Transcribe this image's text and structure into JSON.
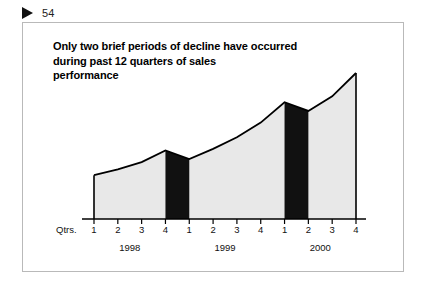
{
  "page": {
    "marker_icon": "play-triangle-icon",
    "folio": "54"
  },
  "figure": {
    "title_lines": [
      "Only two brief periods of decline have occurred",
      "during past 12 quarters of sales",
      "performance"
    ],
    "axis_caption": "Qtrs.",
    "colors": {
      "area_fill": "#e8e8e8",
      "area_stroke": "#000000",
      "highlight_fill": "#111111",
      "axis": "#000000",
      "frame": "#b9b9b9",
      "text": "#000000"
    }
  },
  "chart_data": {
    "type": "area",
    "title": "Only two brief periods of decline have occurred during past 12 quarters of sales performance",
    "xlabel": "Qtrs.",
    "ylabel": "",
    "grid": false,
    "legend": null,
    "categories": [
      "1998 Q1",
      "1998 Q2",
      "1998 Q3",
      "1998 Q4",
      "1999 Q1",
      "1999 Q2",
      "1999 Q3",
      "1999 Q4",
      "2000 Q1",
      "2000 Q2",
      "2000 Q3",
      "2000 Q4"
    ],
    "quarter_ticks": [
      "1",
      "2",
      "3",
      "4",
      "1",
      "2",
      "3",
      "4",
      "1",
      "2",
      "3",
      "4"
    ],
    "year_groups": [
      {
        "label": "1998",
        "quarters": [
          "1",
          "2",
          "3",
          "4"
        ]
      },
      {
        "label": "1999",
        "quarters": [
          "1",
          "2",
          "3",
          "4"
        ]
      },
      {
        "label": "2000",
        "quarters": [
          "1",
          "2",
          "3",
          "4"
        ]
      }
    ],
    "values": [
      30,
      34,
      39,
      47,
      41,
      48,
      56,
      66,
      80,
      74,
      84,
      100
    ],
    "ylim": [
      0,
      100
    ],
    "highlighted_declines": [
      {
        "from": "1998 Q4",
        "to": "1999 Q1",
        "note": "decline"
      },
      {
        "from": "2000 Q1",
        "to": "2000 Q2",
        "note": "decline"
      }
    ]
  }
}
